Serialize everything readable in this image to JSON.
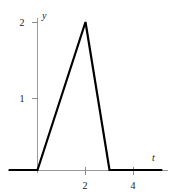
{
  "chart_data": {
    "type": "line",
    "title": "",
    "xlabel": "t",
    "ylabel": "y",
    "xlim": [
      -1.2,
      5.5
    ],
    "ylim": [
      -0.15,
      2.3
    ],
    "grid": false,
    "legend": null,
    "xticks": [
      2,
      4
    ],
    "xtick_labels": [
      "2",
      "4"
    ],
    "yticks": [
      1,
      2
    ],
    "ytick_labels": [
      "1",
      "2"
    ],
    "series": [
      {
        "name": "triangular pulse",
        "color": "#000000",
        "linewidth": 2.2,
        "x": [
          -1.2,
          0,
          2,
          3,
          5.2
        ],
        "y": [
          0,
          0,
          2,
          0,
          0
        ]
      }
    ],
    "annotations": [],
    "axis_color": "#9a9a9a",
    "curve_color": "#000000",
    "background": "#ffffff"
  },
  "labels": {
    "y_axis": "y",
    "x_axis": "t",
    "y_tick_2": "2",
    "y_tick_1": "1",
    "x_tick_2": "2",
    "x_tick_4": "4"
  }
}
